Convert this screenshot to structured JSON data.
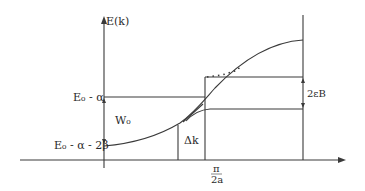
{
  "diagram": {
    "type": "band-structure-sketch",
    "colors": {
      "ink": "#3a3a3a",
      "background": "#ffffff"
    },
    "labels": {
      "y_axis": "E(k)",
      "level_top": "E₀ - α",
      "level_bottom": "E₀ - α - 2β",
      "width": "W₀",
      "gap": "2εB",
      "delta_k": "Δk",
      "x_tick_num": "π",
      "x_tick_den": "2a"
    }
  }
}
